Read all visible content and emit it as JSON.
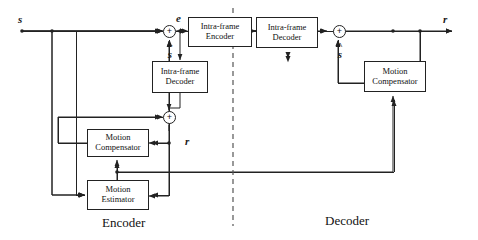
{
  "diagram": {
    "divider": {
      "name": "encoder-decoder-separator",
      "style": "dashed-vertical"
    },
    "sections": [
      {
        "id": "encoder",
        "label": "Encoder"
      },
      {
        "id": "decoder",
        "label": "Decoder"
      }
    ],
    "blocks": [
      {
        "id": "enc-intra-encoder",
        "line1": "Intra-frame",
        "line2": "Encoder"
      },
      {
        "id": "enc-intra-decoder",
        "line1": "Intra-frame",
        "line2": "Decoder"
      },
      {
        "id": "enc-motion-comp",
        "line1": "Motion",
        "line2": "Compensator"
      },
      {
        "id": "enc-motion-est",
        "line1": "Motion",
        "line2": "Estimator"
      },
      {
        "id": "dec-intra-decoder",
        "line1": "Intra-frame",
        "line2": "Decoder"
      },
      {
        "id": "dec-motion-comp",
        "line1": "Motion",
        "line2": "Compensator"
      }
    ],
    "adders": [
      {
        "id": "enc-input-adder",
        "symbol": "+"
      },
      {
        "id": "enc-recon-adder",
        "symbol": "+"
      },
      {
        "id": "dec-recon-adder",
        "symbol": "+"
      }
    ],
    "signals": [
      {
        "id": "input-signal",
        "text": "s"
      },
      {
        "id": "prediction-error",
        "text": "e"
      },
      {
        "id": "encoder-reconstructed",
        "text": "r"
      },
      {
        "id": "decoder-output",
        "text": "r"
      }
    ],
    "accented_signals": [
      {
        "id": "encoder-prediction",
        "mark": "~",
        "base": "s"
      },
      {
        "id": "decoder-prediction",
        "mark": "^",
        "base": "s"
      }
    ],
    "colors": {
      "line": "#222222",
      "background": "#ffffff",
      "text": "#111111"
    }
  }
}
